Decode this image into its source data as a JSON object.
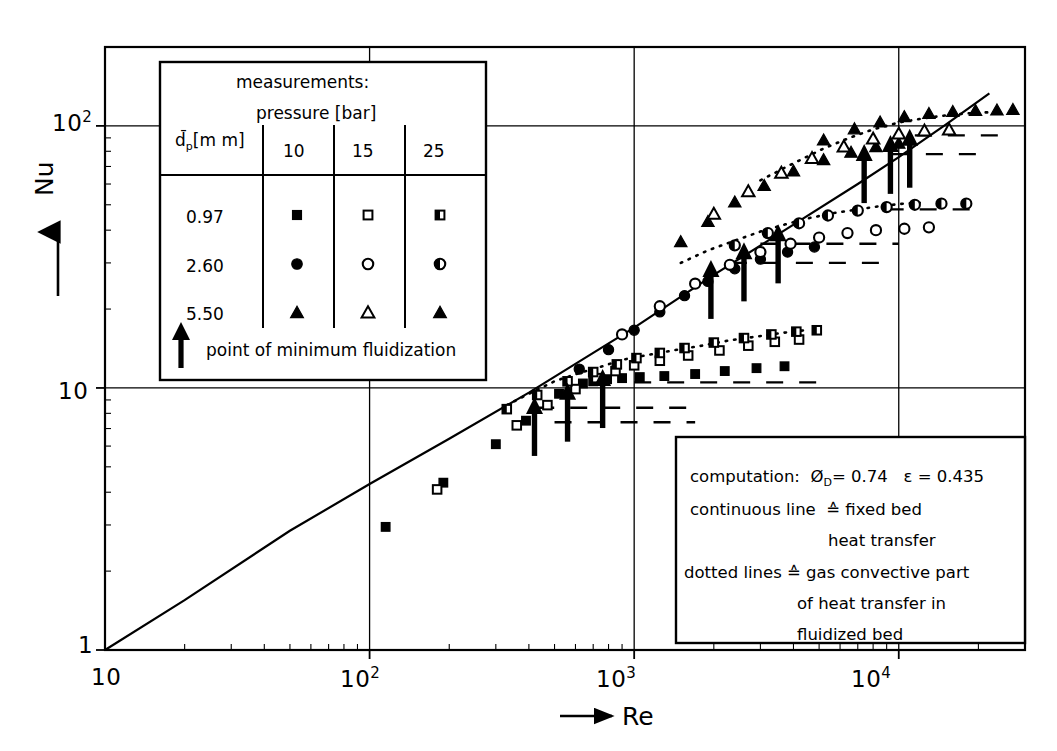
{
  "figure": {
    "title": "",
    "axes": {
      "x_label": "Re",
      "y_label": "Nu",
      "x_ticks": [
        "10",
        "10",
        "10",
        "10"
      ],
      "x_tick_exponents": [
        "",
        "2",
        "3",
        "4"
      ],
      "y_ticks": [
        "1",
        "10",
        "10"
      ],
      "y_tick_exponents": [
        "",
        "",
        "2"
      ],
      "x_arrow": "→",
      "y_arrow": "↑"
    }
  },
  "legend": {
    "title": "measurements:",
    "subtitle": "pressure [bar]",
    "row_header": "d̄",
    "row_header_sub": "p",
    "row_header_unit": "[m m]",
    "columns": [
      "10",
      "15",
      "25"
    ],
    "rows": [
      {
        "dp": "0.97",
        "markers": [
          "filled-square",
          "open-square",
          "half-square"
        ]
      },
      {
        "dp": "2.60",
        "markers": [
          "filled-circle",
          "open-circle",
          "half-circle"
        ]
      },
      {
        "dp": "5.50",
        "markers": [
          "filled-triangle",
          "open-triangle",
          "filled-triangle"
        ]
      }
    ],
    "footnote": "point of minimum fluidization",
    "footnote_icon": "up-arrow"
  },
  "notes": {
    "lines": [
      "computation:  Ø₀ = 0.74    ε = 0.435",
      "continuous line  ≙  fixed bed",
      "heat transfer",
      "dotted lines ≙ gas convective  part",
      "of heat transfer in",
      "fluidized bed"
    ],
    "line1_prefix": "computation:",
    "phi_symbol": "Ø",
    "phi_sub": "D",
    "phi_value": "= 0.74",
    "eps_symbol": "ε",
    "eps_value": "= 0.435",
    "line2": "continuous line",
    "line2b": "≙  fixed bed",
    "line3": "heat transfer",
    "line4": "dotted lines ≙ gas convective  part",
    "line5": "of heat transfer in",
    "line6": "fluidized bed"
  },
  "chart_data": {
    "type": "scatter",
    "title": "",
    "xlabel": "Re",
    "ylabel": "Nu",
    "xscale": "log",
    "yscale": "log",
    "xlim": [
      10,
      30000
    ],
    "ylim": [
      1,
      200
    ],
    "grid": true,
    "grid_x": [
      100,
      1000,
      10000
    ],
    "grid_y": [
      10,
      100
    ],
    "legend_position": "upper-left-inset",
    "annotations": [
      "point of minimum fluidization",
      "computation: ØD = 0.74  ε = 0.435",
      "continuous line ≙ fixed bed heat transfer",
      "dotted lines ≙ gas convective part of heat transfer in fluidized bed"
    ],
    "curves": [
      {
        "name": "fixed bed heat transfer (continuous line)",
        "style": "solid",
        "x": [
          10,
          20,
          50,
          100,
          200,
          400,
          700,
          1000,
          2000,
          4000,
          7000,
          10000,
          15000,
          22000
        ],
        "y": [
          1.0,
          1.55,
          2.85,
          4.3,
          6.4,
          9.6,
          13.6,
          17.0,
          27.0,
          42.0,
          60.0,
          76.0,
          101.0,
          133.0
        ]
      },
      {
        "name": "gas convective part dp=0.97mm (dotted)",
        "style": "dotted",
        "x": [
          330,
          400,
          500,
          620,
          760,
          900,
          1100,
          1400,
          1800,
          2300,
          2900,
          3600,
          4400
        ],
        "y": [
          8.6,
          9.5,
          10.6,
          11.4,
          12.1,
          12.8,
          13.3,
          13.9,
          14.5,
          15.2,
          15.7,
          16.2,
          16.6
        ]
      },
      {
        "name": "gas convective part dp=2.60mm (dotted)",
        "style": "dotted",
        "x": [
          1500,
          1900,
          2400,
          3000,
          3700,
          4600,
          5700,
          7000,
          8600,
          10500,
          12500
        ],
        "y": [
          30.0,
          33.5,
          36.5,
          39.5,
          42.0,
          44.5,
          46.5,
          48.0,
          49.5,
          50.5,
          51.0
        ]
      },
      {
        "name": "gas convective part dp=5.50mm (dotted)",
        "style": "dotted",
        "x": [
          3000,
          4000,
          5200,
          6500,
          8000,
          10000,
          12500,
          15500,
          19000,
          23000
        ],
        "y": [
          62.0,
          72.0,
          82.0,
          90.0,
          97.0,
          103.0,
          107.0,
          110.0,
          112.0,
          113.0
        ]
      }
    ],
    "series": [
      {
        "name": "dp = 0.97 mm, 10 bar",
        "marker": "filled-square",
        "x": [
          115,
          190,
          300,
          390,
          520,
          640,
          700,
          790,
          900,
          1050,
          1300,
          1700,
          2200,
          2900,
          3700
        ],
        "y": [
          2.95,
          4.35,
          6.1,
          7.5,
          9.5,
          10.4,
          10.6,
          10.8,
          10.9,
          11.0,
          11.1,
          11.3,
          11.6,
          11.9,
          12.1
        ]
      },
      {
        "name": "dp = 0.97 mm, 15 bar",
        "marker": "open-square",
        "x": [
          180,
          360,
          470,
          600,
          720,
          850,
          1000,
          1250,
          1600,
          2100,
          2700,
          3400,
          4200
        ],
        "y": [
          4.1,
          7.2,
          8.6,
          9.9,
          10.9,
          11.6,
          12.2,
          12.7,
          13.3,
          13.9,
          14.5,
          15.0,
          15.3
        ]
      },
      {
        "name": "dp = 0.97 mm, 25 bar",
        "marker": "half-square",
        "x": [
          330,
          430,
          560,
          700,
          860,
          1020,
          1250,
          1550,
          2000,
          2600,
          3300,
          4100,
          4900
        ],
        "y": [
          8.3,
          9.4,
          10.6,
          11.5,
          12.3,
          13.0,
          13.6,
          14.2,
          14.9,
          15.5,
          16.0,
          16.4,
          16.6
        ]
      },
      {
        "name": "dp = 2.60 mm, 10 bar",
        "marker": "filled-circle",
        "x": [
          620,
          800,
          1000,
          1250,
          1550,
          1900,
          2400,
          3000,
          3800,
          4800
        ],
        "y": [
          11.8,
          14.0,
          16.6,
          19.5,
          22.5,
          25.5,
          28.5,
          31.0,
          33.0,
          34.5
        ]
      },
      {
        "name": "dp = 2.60 mm, 15 bar",
        "marker": "open-circle",
        "x": [
          900,
          1250,
          1700,
          2300,
          3000,
          3900,
          5000,
          6400,
          8200,
          10500,
          13000
        ],
        "y": [
          16.0,
          20.5,
          25.0,
          29.5,
          33.0,
          35.5,
          37.5,
          39.0,
          40.0,
          40.5,
          41.0
        ]
      },
      {
        "name": "dp = 2.60 mm, 25 bar",
        "marker": "half-circle",
        "x": [
          2400,
          3200,
          4200,
          5400,
          7000,
          9000,
          11500,
          14500,
          18000
        ],
        "y": [
          35.0,
          39.0,
          42.5,
          45.5,
          47.5,
          49.0,
          50.0,
          50.5,
          50.5
        ]
      },
      {
        "name": "dp = 5.50 mm, 10 bar",
        "marker": "filled-triangle",
        "x": [
          1500,
          1900,
          2400,
          3100,
          4000,
          5200,
          6600,
          8200,
          10000
        ],
        "y": [
          36.0,
          43.0,
          51.0,
          59.0,
          67.0,
          74.0,
          79.0,
          83.0,
          85.5
        ]
      },
      {
        "name": "dp = 5.50 mm, 15 bar",
        "marker": "open-triangle",
        "x": [
          2000,
          2700,
          3600,
          4700,
          6200,
          8000,
          10000,
          12500,
          15500
        ],
        "y": [
          46.0,
          56.0,
          66.0,
          75.0,
          83.0,
          89.0,
          93.0,
          95.5,
          96.5
        ]
      },
      {
        "name": "dp = 5.50 mm, 25 bar",
        "marker": "filled-triangle",
        "x": [
          5200,
          6800,
          8500,
          10500,
          13000,
          16000,
          19500,
          23500,
          27000
        ],
        "y": [
          88.0,
          97.0,
          103.0,
          108.0,
          111.0,
          113.0,
          114.0,
          114.5,
          115.0
        ]
      }
    ],
    "minimum_fluidization_arrows": [
      {
        "re": 420,
        "nu": 9.0,
        "label": "dp=0.97mm 10bar"
      },
      {
        "re": 560,
        "nu": 10.2,
        "label": "dp=0.97mm 15bar"
      },
      {
        "re": 760,
        "nu": 11.5,
        "label": "dp=0.97mm 25bar"
      },
      {
        "re": 1950,
        "nu": 30.0,
        "label": "dp=2.60mm 10bar"
      },
      {
        "re": 2600,
        "nu": 35.0,
        "label": "dp=2.60mm 15bar"
      },
      {
        "re": 3500,
        "nu": 41.0,
        "label": "dp=2.60mm 25bar"
      },
      {
        "re": 7400,
        "nu": 83.0,
        "label": "dp=5.50mm 10bar"
      },
      {
        "re": 9300,
        "nu": 90.0,
        "label": "dp=5.50mm 15bar"
      },
      {
        "re": 11000,
        "nu": 95.0,
        "label": "dp=5.50mm 25bar"
      }
    ],
    "dashed_plateau_lines": [
      {
        "nu": 8.4,
        "x_from": 430,
        "x_to": 1600
      },
      {
        "nu": 7.4,
        "x_from": 500,
        "x_to": 1700
      },
      {
        "nu": 10.5,
        "x_from": 1000,
        "x_to": 5200
      },
      {
        "nu": 30.0,
        "x_from": 2300,
        "x_to": 9000
      },
      {
        "nu": 35.5,
        "x_from": 3000,
        "x_to": 10000
      },
      {
        "nu": 48.0,
        "x_from": 9000,
        "x_to": 20000
      },
      {
        "nu": 78.0,
        "x_from": 9500,
        "x_to": 22000
      },
      {
        "nu": 92.0,
        "x_from": 11500,
        "x_to": 25000
      }
    ]
  }
}
